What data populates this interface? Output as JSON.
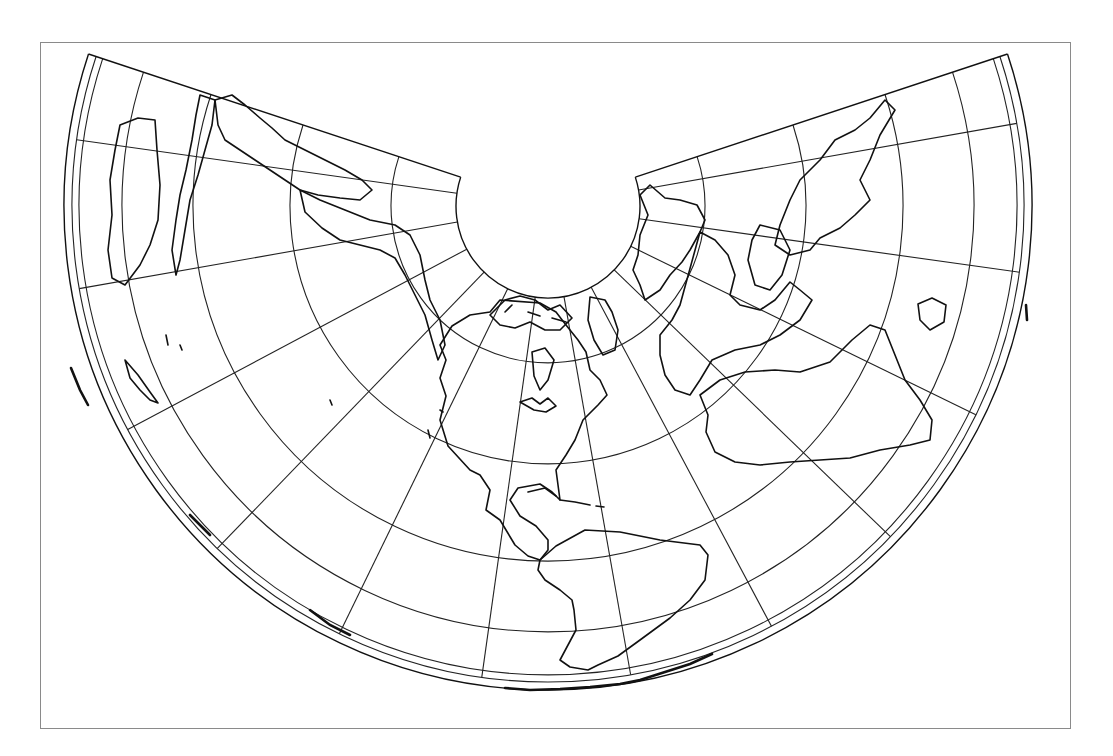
{
  "figure": {
    "type": "map",
    "projection": "conic (Lambert-like), north polar cone unrolled",
    "frame": {
      "left": 40,
      "top": 42,
      "right": 1071,
      "bottom": 729,
      "stroke": "#8a8a8a"
    },
    "cone": {
      "apex": [
        548,
        206
      ],
      "half_angle_deg": 108.3,
      "inner_radius": 92,
      "outer_radius": 484
    },
    "parallel_radii": [
      157,
      258,
      355,
      426,
      469,
      476
    ],
    "meridian_angles_deg": [
      -98,
      -80,
      -62,
      -44,
      -26,
      -8,
      10,
      28,
      46,
      64,
      82,
      100
    ],
    "meridian_extent": {
      "from_radius": 92,
      "to_radius": 476
    },
    "colors": {
      "line": "#222222",
      "coast": "#111111",
      "background": "#ffffff"
    }
  },
  "caption": {
    "visible": "truncated",
    "text": ""
  }
}
